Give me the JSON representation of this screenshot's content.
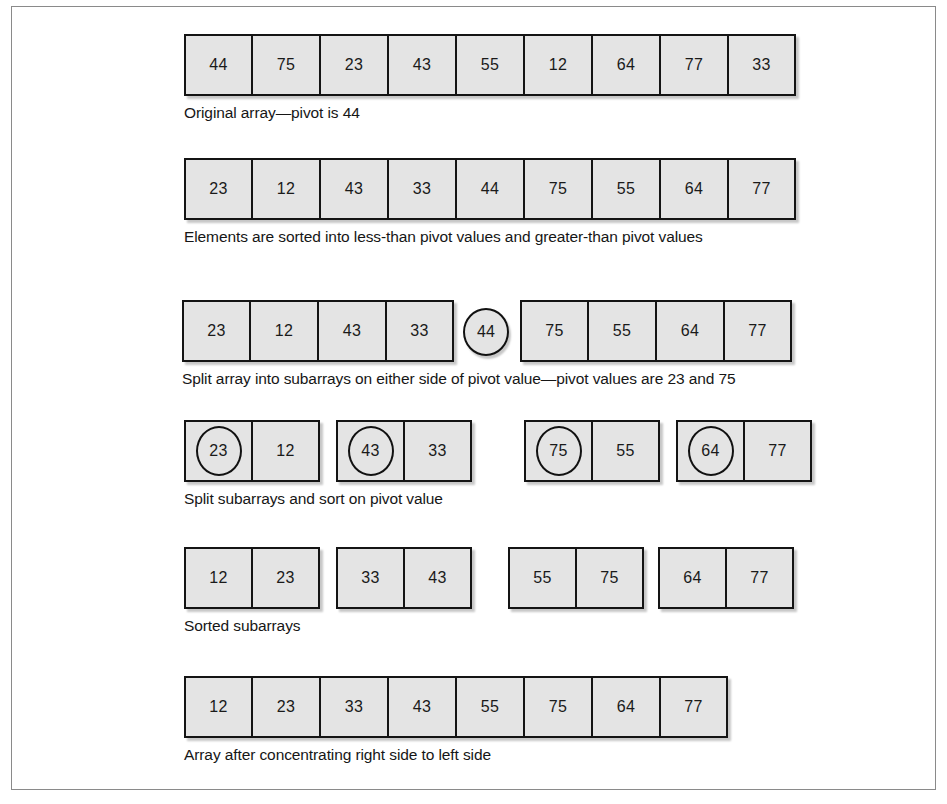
{
  "figure": {
    "cell_fill": "#e4e4e4",
    "cell_border": "#141414",
    "frame_border": "#8a8a8a",
    "text_color": "#161616"
  },
  "stages": [
    {
      "id": "stage-1-original",
      "caption": "Original array—pivot is 44",
      "groups": [
        {
          "id": "group-full-array",
          "left": 0,
          "cells": [
            {
              "value": "44",
              "pivot": false
            },
            {
              "value": "75",
              "pivot": false
            },
            {
              "value": "23",
              "pivot": false
            },
            {
              "value": "43",
              "pivot": false
            },
            {
              "value": "55",
              "pivot": false
            },
            {
              "value": "12",
              "pivot": false
            },
            {
              "value": "64",
              "pivot": false
            },
            {
              "value": "77",
              "pivot": false
            },
            {
              "value": "33",
              "pivot": false
            }
          ]
        }
      ],
      "bubbles": []
    },
    {
      "id": "stage-2-partitioned",
      "caption": "Elements are sorted into less-than pivot values and greater-than pivot values",
      "groups": [
        {
          "id": "group-partitioned-array",
          "left": 0,
          "cells": [
            {
              "value": "23",
              "pivot": false
            },
            {
              "value": "12",
              "pivot": false
            },
            {
              "value": "43",
              "pivot": false
            },
            {
              "value": "33",
              "pivot": false
            },
            {
              "value": "44",
              "pivot": false
            },
            {
              "value": "75",
              "pivot": false
            },
            {
              "value": "55",
              "pivot": false
            },
            {
              "value": "64",
              "pivot": false
            },
            {
              "value": "77",
              "pivot": false
            }
          ]
        }
      ],
      "bubbles": []
    },
    {
      "id": "stage-3-split",
      "caption": "Split array into subarrays on either side of pivot value—pivot values are 23 and 75",
      "groups": [
        {
          "id": "group-left-subarray",
          "left": 0,
          "cells": [
            {
              "value": "23",
              "pivot": false
            },
            {
              "value": "12",
              "pivot": false
            },
            {
              "value": "43",
              "pivot": false
            },
            {
              "value": "33",
              "pivot": false
            }
          ]
        },
        {
          "id": "group-right-subarray",
          "left": 338,
          "cells": [
            {
              "value": "75",
              "pivot": false
            },
            {
              "value": "55",
              "pivot": false
            },
            {
              "value": "64",
              "pivot": false
            },
            {
              "value": "77",
              "pivot": false
            }
          ]
        }
      ],
      "bubbles": [
        {
          "id": "pivot-44",
          "value": "44",
          "left": 281
        }
      ]
    },
    {
      "id": "stage-4-subsplit",
      "caption": "Split subarrays and sort on pivot value",
      "groups": [
        {
          "id": "group-sub-1",
          "left": 0,
          "cells": [
            {
              "value": "23",
              "pivot": true
            },
            {
              "value": "12",
              "pivot": false
            }
          ]
        },
        {
          "id": "group-sub-2",
          "left": 152,
          "cells": [
            {
              "value": "43",
              "pivot": true
            },
            {
              "value": "33",
              "pivot": false
            }
          ]
        },
        {
          "id": "group-sub-3",
          "left": 340,
          "cells": [
            {
              "value": "75",
              "pivot": true
            },
            {
              "value": "55",
              "pivot": false
            }
          ]
        },
        {
          "id": "group-sub-4",
          "left": 492,
          "cells": [
            {
              "value": "64",
              "pivot": true
            },
            {
              "value": "77",
              "pivot": false
            }
          ]
        }
      ],
      "bubbles": []
    },
    {
      "id": "stage-5-sorted-subarrays",
      "caption": "Sorted subarrays",
      "groups": [
        {
          "id": "group-sorted-1",
          "left": 0,
          "cells": [
            {
              "value": "12",
              "pivot": false
            },
            {
              "value": "23",
              "pivot": false
            }
          ]
        },
        {
          "id": "group-sorted-2",
          "left": 152,
          "cells": [
            {
              "value": "33",
              "pivot": false
            },
            {
              "value": "43",
              "pivot": false
            }
          ]
        },
        {
          "id": "group-sorted-3",
          "left": 324,
          "cells": [
            {
              "value": "55",
              "pivot": false
            },
            {
              "value": "75",
              "pivot": false
            }
          ]
        },
        {
          "id": "group-sorted-4",
          "left": 474,
          "cells": [
            {
              "value": "64",
              "pivot": false
            },
            {
              "value": "77",
              "pivot": false
            }
          ]
        }
      ],
      "bubbles": []
    },
    {
      "id": "stage-6-final",
      "caption": "Array after concentrating right side to left side",
      "groups": [
        {
          "id": "group-final-array",
          "left": 0,
          "cells": [
            {
              "value": "12",
              "pivot": false
            },
            {
              "value": "23",
              "pivot": false
            },
            {
              "value": "33",
              "pivot": false
            },
            {
              "value": "43",
              "pivot": false
            },
            {
              "value": "55",
              "pivot": false
            },
            {
              "value": "75",
              "pivot": false
            },
            {
              "value": "64",
              "pivot": false
            },
            {
              "value": "77",
              "pivot": false
            }
          ]
        }
      ],
      "bubbles": []
    }
  ],
  "layout": {
    "stage_tops": [
      27,
      151,
      293,
      413,
      540,
      669
    ],
    "stage_lefts": [
      172,
      172,
      170,
      172,
      172,
      172
    ],
    "caption_tops": [
      70,
      70,
      70,
      70,
      70,
      70
    ]
  }
}
